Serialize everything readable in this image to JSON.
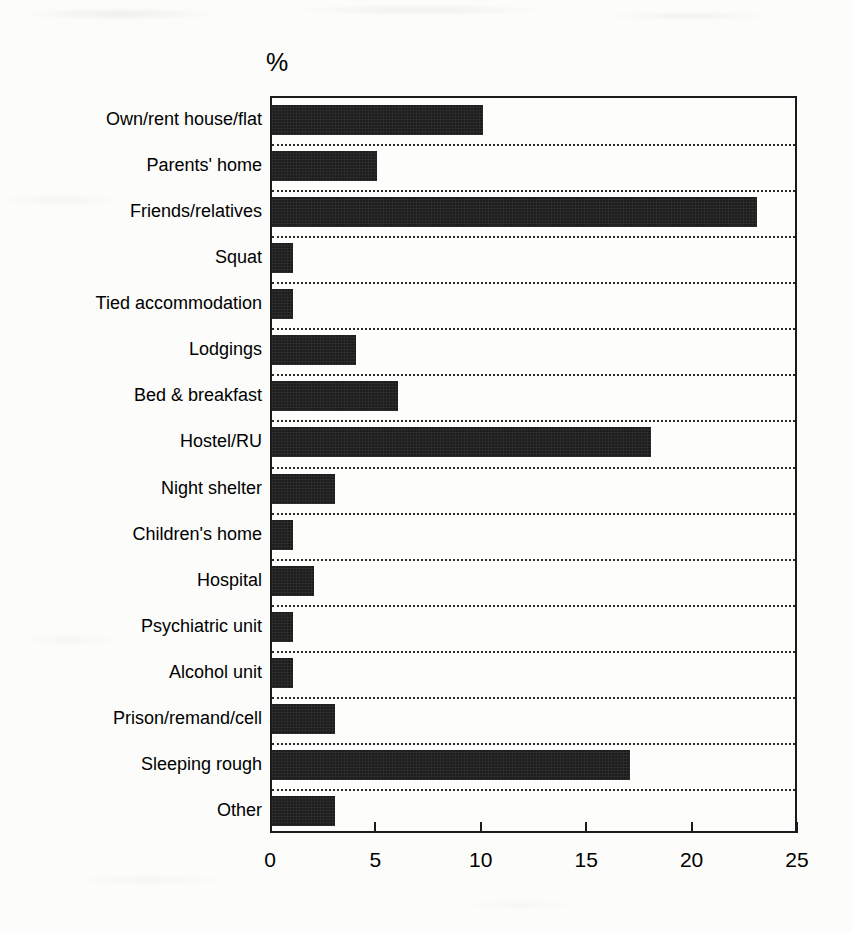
{
  "chart_data": {
    "type": "bar",
    "orientation": "horizontal",
    "title": "",
    "subtitle": "",
    "xlabel": "",
    "ylabel": "",
    "unit_label": "%",
    "xlim": [
      0,
      25
    ],
    "ylim": null,
    "xticks": [
      0,
      5,
      10,
      15,
      20,
      25
    ],
    "xticklabels": [
      "0",
      "5",
      "10",
      "15",
      "20",
      "25"
    ],
    "grid": "horizontal-dotted",
    "legend": null,
    "bar_color": "#1d1d1d",
    "background_color": "#fcfcfb",
    "axis_color": "#1b1b1b",
    "categories": [
      "Own/rent house/flat",
      "Parents' home",
      "Friends/relatives",
      "Squat",
      "Tied accommodation",
      "Lodgings",
      "Bed & breakfast",
      "Hostel/RU",
      "Night shelter",
      "Children's home",
      "Hospital",
      "Psychiatric unit",
      "Alcohol unit",
      "Prison/remand/cell",
      "Sleeping rough",
      "Other"
    ],
    "values": [
      10,
      5,
      23,
      1,
      1,
      4,
      6,
      18,
      3,
      1,
      2,
      1,
      1,
      3,
      17,
      3
    ]
  }
}
